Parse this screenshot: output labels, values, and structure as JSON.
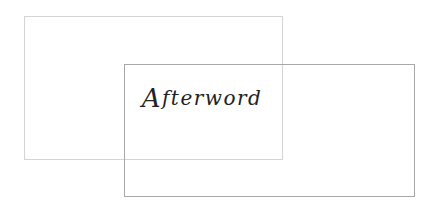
{
  "page": {
    "title_initial": "A",
    "title_rest": "fterword"
  },
  "colors": {
    "back_frame": "#d4d4d4",
    "front_frame": "#a8a8a8",
    "text": "#222222"
  }
}
